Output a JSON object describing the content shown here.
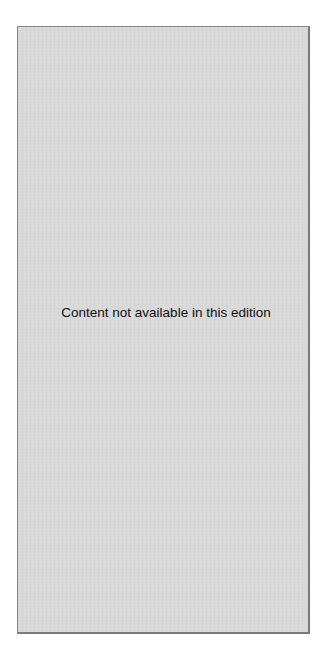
{
  "panel": {
    "message": "Content not available in this edition",
    "background_color": "#d9d9d9",
    "border_color": "#8a8a8a"
  }
}
